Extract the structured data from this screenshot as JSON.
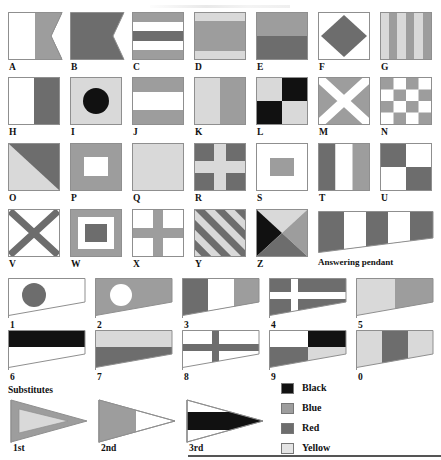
{
  "palette": {
    "black": "#111111",
    "blue": "#9d9d9d",
    "red": "#6d6d6d",
    "yellow": "#d9d9d9",
    "white": "#ffffff",
    "outline": "#8f8f8f"
  },
  "legend": {
    "items": [
      {
        "label": "Black",
        "color": "#111111"
      },
      {
        "label": "Blue",
        "color": "#9d9d9d"
      },
      {
        "label": "Red",
        "color": "#6d6d6d"
      },
      {
        "label": "Yellow",
        "color": "#d9d9d9"
      }
    ]
  },
  "sections": {
    "substitutes_heading": "Substitutes",
    "answering_pendant_label": "Answering pendant"
  },
  "alphabet": [
    {
      "label": "A",
      "name": "alfa",
      "shape": "swallowtail",
      "desc": "white hoist, blue fly, swallowtail"
    },
    {
      "label": "B",
      "name": "bravo",
      "shape": "swallowtail",
      "desc": "all red, swallowtail"
    },
    {
      "label": "C",
      "name": "charlie",
      "shape": "rect",
      "desc": "blue-white-red-white-blue horizontal bands"
    },
    {
      "label": "D",
      "name": "delta",
      "shape": "rect",
      "desc": "yellow-blue-yellow horizontal bands"
    },
    {
      "label": "E",
      "name": "echo",
      "shape": "rect",
      "desc": "blue over red"
    },
    {
      "label": "F",
      "name": "foxtrot",
      "shape": "rect",
      "desc": "white with red diamond"
    },
    {
      "label": "G",
      "name": "golf",
      "shape": "rect",
      "desc": "six vertical yellow and blue stripes"
    },
    {
      "label": "H",
      "name": "hotel",
      "shape": "rect",
      "desc": "white hoist, red fly"
    },
    {
      "label": "I",
      "name": "india",
      "shape": "rect",
      "desc": "yellow with black circle"
    },
    {
      "label": "J",
      "name": "juliett",
      "shape": "rect",
      "desc": "blue-white-blue horizontal bands"
    },
    {
      "label": "K",
      "name": "kilo",
      "shape": "rect",
      "desc": "yellow hoist, blue fly"
    },
    {
      "label": "L",
      "name": "lima",
      "shape": "rect",
      "desc": "yellow and black quarters"
    },
    {
      "label": "M",
      "name": "mike",
      "shape": "rect",
      "desc": "blue with white saltire"
    },
    {
      "label": "N",
      "name": "november",
      "shape": "rect",
      "desc": "blue and white checkerboard 4x4"
    },
    {
      "label": "O",
      "name": "oscar",
      "shape": "rect",
      "desc": "yellow and red diagonal halves"
    },
    {
      "label": "P",
      "name": "papa",
      "shape": "rect",
      "desc": "blue with white rectangle"
    },
    {
      "label": "Q",
      "name": "quebec",
      "shape": "rect",
      "desc": "all yellow"
    },
    {
      "label": "R",
      "name": "romeo",
      "shape": "rect",
      "desc": "red with yellow cross"
    },
    {
      "label": "S",
      "name": "sierra",
      "shape": "rect",
      "desc": "white with blue rectangle"
    },
    {
      "label": "T",
      "name": "tango",
      "shape": "rect",
      "desc": "red-white-blue vertical bands"
    },
    {
      "label": "U",
      "name": "uniform",
      "shape": "rect",
      "desc": "red and white quarters"
    },
    {
      "label": "V",
      "name": "victor",
      "shape": "rect",
      "desc": "white with red saltire"
    },
    {
      "label": "W",
      "name": "whiskey",
      "shape": "rect",
      "desc": "blue border, white frame, red centre"
    },
    {
      "label": "X",
      "name": "xray",
      "shape": "rect",
      "desc": "white with blue cross"
    },
    {
      "label": "Y",
      "name": "yankee",
      "shape": "rect",
      "desc": "yellow and red diagonal stripes"
    },
    {
      "label": "Z",
      "name": "zulu",
      "shape": "rect",
      "desc": "four triangles: yellow, black, blue, red"
    }
  ],
  "answering_pendant": {
    "label": "Answering pendant",
    "desc": "tapering pennant, red-white-red-white-red vertical bands"
  },
  "numerals": [
    {
      "label": "1",
      "desc": "white pennant with red circle"
    },
    {
      "label": "2",
      "desc": "blue pennant with white circle"
    },
    {
      "label": "3",
      "desc": "red-white-blue vertical bands"
    },
    {
      "label": "4",
      "desc": "red with white cross"
    },
    {
      "label": "5",
      "desc": "yellow hoist, blue fly"
    },
    {
      "label": "6",
      "desc": "black over white"
    },
    {
      "label": "7",
      "desc": "yellow over red"
    },
    {
      "label": "8",
      "desc": "white with red cross"
    },
    {
      "label": "9",
      "desc": "white, black, red, yellow quarters"
    },
    {
      "label": "0",
      "desc": "yellow-red-yellow vertical bands"
    }
  ],
  "substitutes": [
    {
      "label": "1st",
      "desc": "blue triangular pennant with yellow inner triangle"
    },
    {
      "label": "2nd",
      "desc": "blue hoist, white triangular fly"
    },
    {
      "label": "3rd",
      "desc": "white triangular pennant with black horizontal band"
    }
  ]
}
